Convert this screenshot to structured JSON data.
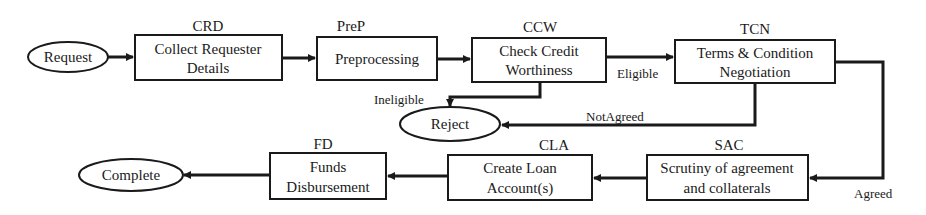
{
  "diagram": {
    "type": "flowchart",
    "colors": {
      "stroke": "#1a1a1a",
      "background": "#ffffff"
    },
    "terminals": {
      "request": {
        "label": "Request"
      },
      "reject": {
        "label": "Reject"
      },
      "complete": {
        "label": "Complete"
      }
    },
    "steps": {
      "crd": {
        "code": "CRD",
        "line1": "Collect Requester",
        "line2": "Details"
      },
      "prep": {
        "code": "PreP",
        "line1": "Preprocessing"
      },
      "ccw": {
        "code": "CCW",
        "line1": "Check Credit",
        "line2": "Worthiness"
      },
      "tcn": {
        "code": "TCN",
        "line1": "Terms & Condition",
        "line2": "Negotiation"
      },
      "sac": {
        "code": "SAC",
        "line1": "Scrutiny of agreement",
        "line2": "and collaterals"
      },
      "cla": {
        "code": "CLA",
        "line1": "Create Loan",
        "line2": "Account(s)"
      },
      "fd": {
        "code": "FD",
        "line1": "Funds",
        "line2": "Disbursement"
      }
    },
    "edge_labels": {
      "eligible": "Eligible",
      "ineligible": "Ineligible",
      "not_agreed": "NotAgreed",
      "agreed": "Agreed"
    },
    "edges": [
      {
        "from": "Request",
        "to": "CRD"
      },
      {
        "from": "CRD",
        "to": "PreP"
      },
      {
        "from": "PreP",
        "to": "CCW"
      },
      {
        "from": "CCW",
        "to": "TCN",
        "label": "Eligible"
      },
      {
        "from": "CCW",
        "to": "Reject",
        "label": "Ineligible"
      },
      {
        "from": "TCN",
        "to": "Reject",
        "label": "NotAgreed"
      },
      {
        "from": "TCN",
        "to": "SAC",
        "label": "Agreed"
      },
      {
        "from": "SAC",
        "to": "CLA"
      },
      {
        "from": "CLA",
        "to": "FD"
      },
      {
        "from": "FD",
        "to": "Complete"
      }
    ]
  }
}
